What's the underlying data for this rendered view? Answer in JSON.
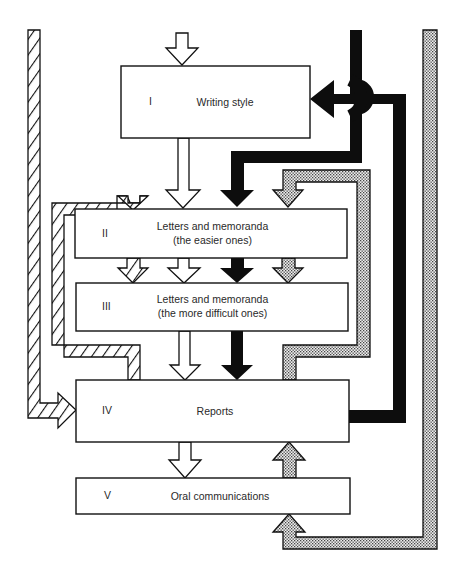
{
  "diagram": {
    "type": "flow",
    "stages": [
      {
        "numeral": "I",
        "title": "Writing style",
        "subtitle": ""
      },
      {
        "numeral": "II",
        "title": "Letters and memoranda",
        "subtitle": "(the easier ones)"
      },
      {
        "numeral": "III",
        "title": "Letters and memoranda",
        "subtitle": "(the more difficult ones)"
      },
      {
        "numeral": "IV",
        "title": "Reports",
        "subtitle": ""
      },
      {
        "numeral": "V",
        "title": "Oral communications",
        "subtitle": ""
      }
    ],
    "paths": [
      {
        "style": "white",
        "description": "main flow: entry -> I -> II -> III -> IV -> V"
      },
      {
        "style": "hatched",
        "description": "outer loop into IV; inner loop from IV back to II -> III"
      },
      {
        "style": "black",
        "description": "from top into II -> III -> IV; IV back to I with bridge crossing"
      },
      {
        "style": "dotted",
        "description": "IV back to II -> III; outer loop from top into V bottom -> IV"
      }
    ],
    "colors": {
      "line": "#111111",
      "fill_white": "#ffffff",
      "fill_black": "#0d0d0d",
      "dot": "#555555",
      "text": "#2a2a2a"
    }
  }
}
